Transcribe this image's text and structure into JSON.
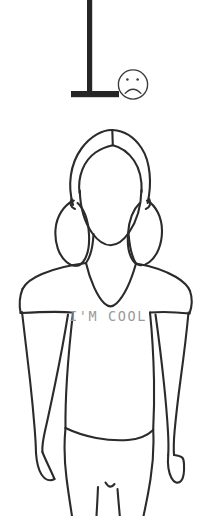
{
  "illustration": {
    "title": "Line drawing of a girl with pigtails wearing an I'M COOL t-shirt",
    "background_color": "#ffffff",
    "ink_color": "#2b2b2b",
    "canvas": {
      "width": 210,
      "height": 516
    }
  },
  "emoticon": {
    "name": "sad-face",
    "expression": "frowning",
    "eye_count": 2,
    "outline_color": "#3a3a3a",
    "center": {
      "x": 133,
      "y": 84
    },
    "radius": 15
  },
  "pole": {
    "name": "t-shaped-pole",
    "fill_color": "#262626",
    "post": {
      "x": 87,
      "y": 0,
      "width": 5,
      "height": 93
    },
    "base": {
      "x": 71,
      "y": 91,
      "width": 48,
      "height": 6
    }
  },
  "figure": {
    "head": {
      "label": "head",
      "outline_color": "#2b2b2b"
    },
    "hair": {
      "label": "hair with center part and two pigtails",
      "pigtails": 2
    },
    "neck": {
      "label": "neck"
    },
    "shirt": {
      "label": "short sleeve v-neck t-shirt",
      "neckline": "v-neck",
      "sleeve": "short",
      "print_text": "I'M COOL",
      "print_color": "#9a9a9a"
    },
    "arms": {
      "label": "arms at sides",
      "count": 2
    },
    "waistline": {
      "label": "waistline hem"
    },
    "legs": {
      "label": "legs",
      "count": 2,
      "cropped": true
    }
  }
}
